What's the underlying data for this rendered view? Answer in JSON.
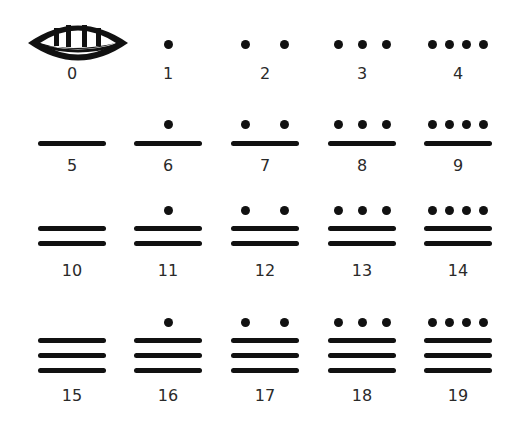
{
  "colors": {
    "ink": "#111111",
    "label": "#2a2a2a",
    "background": "#ffffff"
  },
  "layout": {
    "column_centers": [
      72,
      168,
      265,
      362,
      458
    ],
    "rows": [
      {
        "bar_top": 143,
        "label_y": 165,
        "dot_y": 129
      },
      {
        "bar_top": 143,
        "label_y": 165,
        "dot_y": 129
      },
      {
        "bar_top": 230,
        "label_y": 262,
        "dot_y": 214
      },
      {
        "bar_top": 342,
        "label_y": 387,
        "dot_y": 326
      }
    ],
    "bar_spacing": 15,
    "bar_width": 68
  },
  "numerals": [
    {
      "value": 0,
      "label": "0",
      "dots": 0,
      "bars": 0,
      "glyph": "shell"
    },
    {
      "value": 1,
      "label": "1",
      "dots": 1,
      "bars": 0
    },
    {
      "value": 2,
      "label": "2",
      "dots": 2,
      "bars": 0
    },
    {
      "value": 3,
      "label": "3",
      "dots": 3,
      "bars": 0
    },
    {
      "value": 4,
      "label": "4",
      "dots": 4,
      "bars": 0
    },
    {
      "value": 5,
      "label": "5",
      "dots": 0,
      "bars": 1
    },
    {
      "value": 6,
      "label": "6",
      "dots": 1,
      "bars": 1
    },
    {
      "value": 7,
      "label": "7",
      "dots": 2,
      "bars": 1
    },
    {
      "value": 8,
      "label": "8",
      "dots": 3,
      "bars": 1
    },
    {
      "value": 9,
      "label": "9",
      "dots": 4,
      "bars": 1
    },
    {
      "value": 10,
      "label": "10",
      "dots": 0,
      "bars": 2
    },
    {
      "value": 11,
      "label": "11",
      "dots": 1,
      "bars": 2
    },
    {
      "value": 12,
      "label": "12",
      "dots": 2,
      "bars": 2
    },
    {
      "value": 13,
      "label": "13",
      "dots": 3,
      "bars": 2
    },
    {
      "value": 14,
      "label": "14",
      "dots": 4,
      "bars": 2
    },
    {
      "value": 15,
      "label": "15",
      "dots": 0,
      "bars": 3
    },
    {
      "value": 16,
      "label": "16",
      "dots": 1,
      "bars": 3
    },
    {
      "value": 17,
      "label": "17",
      "dots": 2,
      "bars": 3
    },
    {
      "value": 18,
      "label": "18",
      "dots": 3,
      "bars": 3
    },
    {
      "value": 19,
      "label": "19",
      "dots": 4,
      "bars": 3
    }
  ]
}
